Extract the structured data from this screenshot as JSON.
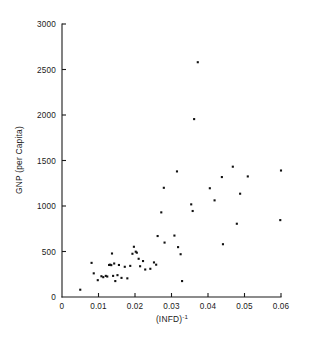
{
  "chart_data": {
    "type": "scatter",
    "title": "",
    "xlabel": "(INFD)-1",
    "xlabel_base": "(INFD)",
    "xlabel_exponent": "-1",
    "ylabel": "GNP (per Capita)",
    "xlim": [
      0,
      0.06
    ],
    "ylim": [
      0,
      3000
    ],
    "xticks": [
      0,
      0.01,
      0.02,
      0.03,
      0.04,
      0.05,
      0.06
    ],
    "xtick_labels": [
      "0",
      "0.01",
      "0.02",
      "0.03",
      "0.04",
      "0.05",
      "0.06"
    ],
    "yticks": [
      0,
      500,
      1000,
      1500,
      2000,
      2500,
      3000
    ],
    "ytick_labels": [
      "0",
      "500",
      "1000",
      "1500",
      "2000",
      "2500",
      "3000"
    ],
    "grid": false,
    "legend": null,
    "marker": "square",
    "marker_color": "#111111",
    "marker_size": 2.1,
    "points": [
      {
        "x": 0.005,
        "y": 80
      },
      {
        "x": 0.0081,
        "y": 375
      },
      {
        "x": 0.0087,
        "y": 260
      },
      {
        "x": 0.0098,
        "y": 185
      },
      {
        "x": 0.0108,
        "y": 228
      },
      {
        "x": 0.0113,
        "y": 218
      },
      {
        "x": 0.012,
        "y": 232
      },
      {
        "x": 0.0124,
        "y": 225
      },
      {
        "x": 0.0129,
        "y": 352
      },
      {
        "x": 0.0132,
        "y": 355
      },
      {
        "x": 0.0135,
        "y": 350
      },
      {
        "x": 0.0137,
        "y": 478
      },
      {
        "x": 0.014,
        "y": 232
      },
      {
        "x": 0.0143,
        "y": 368
      },
      {
        "x": 0.0146,
        "y": 175
      },
      {
        "x": 0.0152,
        "y": 240
      },
      {
        "x": 0.0156,
        "y": 352
      },
      {
        "x": 0.0163,
        "y": 210
      },
      {
        "x": 0.0172,
        "y": 332
      },
      {
        "x": 0.0179,
        "y": 205
      },
      {
        "x": 0.0187,
        "y": 342
      },
      {
        "x": 0.0193,
        "y": 475
      },
      {
        "x": 0.0197,
        "y": 552
      },
      {
        "x": 0.0202,
        "y": 498
      },
      {
        "x": 0.0205,
        "y": 487
      },
      {
        "x": 0.021,
        "y": 420
      },
      {
        "x": 0.0214,
        "y": 338
      },
      {
        "x": 0.0222,
        "y": 395
      },
      {
        "x": 0.0228,
        "y": 302
      },
      {
        "x": 0.0242,
        "y": 310
      },
      {
        "x": 0.0252,
        "y": 380
      },
      {
        "x": 0.0258,
        "y": 355
      },
      {
        "x": 0.0262,
        "y": 670
      },
      {
        "x": 0.0272,
        "y": 930
      },
      {
        "x": 0.0279,
        "y": 1200
      },
      {
        "x": 0.0281,
        "y": 598
      },
      {
        "x": 0.0308,
        "y": 675
      },
      {
        "x": 0.0315,
        "y": 1380
      },
      {
        "x": 0.0318,
        "y": 548
      },
      {
        "x": 0.0325,
        "y": 470
      },
      {
        "x": 0.0329,
        "y": 175
      },
      {
        "x": 0.0354,
        "y": 1018
      },
      {
        "x": 0.0358,
        "y": 945
      },
      {
        "x": 0.0362,
        "y": 1955
      },
      {
        "x": 0.0372,
        "y": 2580
      },
      {
        "x": 0.0405,
        "y": 1195
      },
      {
        "x": 0.0418,
        "y": 1062
      },
      {
        "x": 0.0438,
        "y": 1318
      },
      {
        "x": 0.0441,
        "y": 580
      },
      {
        "x": 0.0468,
        "y": 1432
      },
      {
        "x": 0.0479,
        "y": 805
      },
      {
        "x": 0.0488,
        "y": 1135
      },
      {
        "x": 0.0509,
        "y": 1325
      },
      {
        "x": 0.0598,
        "y": 845
      },
      {
        "x": 0.06,
        "y": 1390
      }
    ]
  }
}
